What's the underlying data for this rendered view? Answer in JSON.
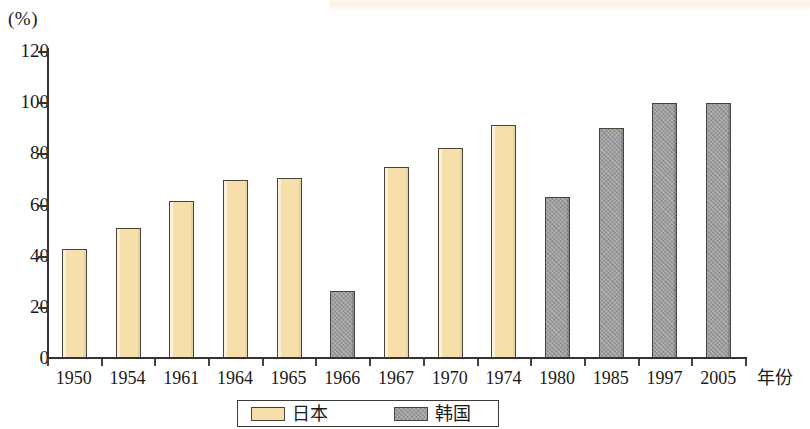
{
  "chart_data": {
    "type": "bar",
    "title": "",
    "subtitle": "",
    "xlabel": "年份",
    "ylabel": "(%)",
    "ylim": [
      0,
      120
    ],
    "y_ticks": [
      0,
      20,
      40,
      60,
      80,
      100,
      120
    ],
    "grid": false,
    "legend_position": "bottom",
    "categories": [
      "1950",
      "1954",
      "1961",
      "1964",
      "1965",
      "1966",
      "1967",
      "1970",
      "1974",
      "1980",
      "1985",
      "1997",
      "2005"
    ],
    "series": [
      {
        "name": "日本",
        "color": "#f7dfab",
        "values": [
          42.5,
          51,
          61.5,
          69.5,
          70.5,
          null,
          74.5,
          82,
          91,
          null,
          null,
          null,
          null
        ]
      },
      {
        "name": "韩国",
        "color": "#9c9c9c",
        "values": [
          null,
          null,
          null,
          null,
          null,
          26,
          null,
          null,
          null,
          63,
          90,
          99.5,
          99.5
        ]
      }
    ],
    "points": [
      {
        "category": "1950",
        "series": "日本",
        "value": 42.5
      },
      {
        "category": "1954",
        "series": "日本",
        "value": 51
      },
      {
        "category": "1961",
        "series": "日本",
        "value": 61.5
      },
      {
        "category": "1964",
        "series": "日本",
        "value": 69.5
      },
      {
        "category": "1965",
        "series": "日本",
        "value": 70.5
      },
      {
        "category": "1966",
        "series": "韩国",
        "value": 26
      },
      {
        "category": "1967",
        "series": "日本",
        "value": 74.5
      },
      {
        "category": "1970",
        "series": "日本",
        "value": 82
      },
      {
        "category": "1974",
        "series": "日本",
        "value": 91
      },
      {
        "category": "1980",
        "series": "韩国",
        "value": 63
      },
      {
        "category": "1985",
        "series": "韩国",
        "value": 90
      },
      {
        "category": "1997",
        "series": "韩国",
        "value": 99.5
      },
      {
        "category": "2005",
        "series": "韩国",
        "value": 99.5
      }
    ]
  },
  "legend": {
    "items": [
      {
        "label": "日本",
        "key": "jp"
      },
      {
        "label": "韩国",
        "key": "kr"
      }
    ]
  }
}
